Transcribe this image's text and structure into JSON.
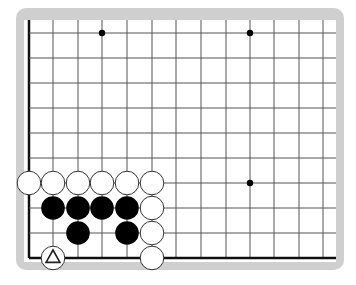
{
  "diagram": {
    "type": "go-board-partial",
    "colors": {
      "frame": "#cfcfcf",
      "board": "#ffffff",
      "grid_line": "#555555",
      "edge_line": "#111111",
      "black_stone": "#000000",
      "white_stone_fill": "#ffffff",
      "white_stone_stroke": "#333333"
    },
    "grid": {
      "x_lines": [
        29,
        53,
        78,
        102,
        127,
        152,
        176,
        201,
        226,
        250,
        274,
        299,
        323
      ],
      "y_lines": [
        33,
        58,
        83,
        108,
        133,
        158,
        183,
        208,
        233,
        258
      ],
      "left_edge": true,
      "bottom_edge": true,
      "top_open": true,
      "right_open": true
    },
    "star_points": [
      {
        "x": 102,
        "y": 33
      },
      {
        "x": 250,
        "y": 33
      },
      {
        "x": 250,
        "y": 183
      }
    ],
    "stones": [
      {
        "color": "white",
        "col": 0,
        "row": 6
      },
      {
        "color": "white",
        "col": 1,
        "row": 6
      },
      {
        "color": "white",
        "col": 2,
        "row": 6
      },
      {
        "color": "white",
        "col": 3,
        "row": 6
      },
      {
        "color": "white",
        "col": 4,
        "row": 6
      },
      {
        "color": "white",
        "col": 5,
        "row": 6
      },
      {
        "color": "black",
        "col": 1,
        "row": 7
      },
      {
        "color": "black",
        "col": 2,
        "row": 7
      },
      {
        "color": "black",
        "col": 3,
        "row": 7
      },
      {
        "color": "black",
        "col": 4,
        "row": 7
      },
      {
        "color": "white",
        "col": 5,
        "row": 7
      },
      {
        "color": "black",
        "col": 2,
        "row": 8
      },
      {
        "color": "black",
        "col": 4,
        "row": 8
      },
      {
        "color": "white",
        "col": 5,
        "row": 8
      },
      {
        "color": "white",
        "col": 1,
        "row": 9,
        "marker": "triangle"
      },
      {
        "color": "white",
        "col": 5,
        "row": 9
      }
    ]
  }
}
